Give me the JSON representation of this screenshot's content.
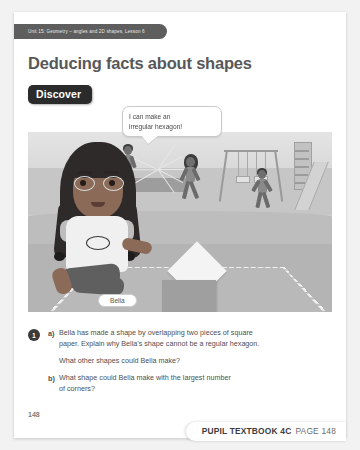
{
  "page": {
    "unit_banner": "Unit 15: Geometry – angles and 2D shapes, Lesson 6",
    "title": "Deducing facts about shapes",
    "section_badge": "Discover",
    "folio": "148"
  },
  "illustration": {
    "speech_bubble": {
      "line1": "I can make an",
      "line2": "irregular hexagon!"
    },
    "character_label": "Bella",
    "scene_items": [
      "swing-frame",
      "slide",
      "climbing-frame",
      "bench",
      "running-children"
    ]
  },
  "questions": [
    {
      "number": "1",
      "parts": [
        {
          "letter": "a)",
          "lines": [
            "Bella has made a shape by overlapping two pieces of square",
            "paper. Explain why Bella's shape cannot be a regular hexagon."
          ],
          "followup": "What other shapes could Bella make?"
        },
        {
          "letter": "b)",
          "lines": [
            "What shape could Bella make with the largest number",
            "of corners?"
          ]
        }
      ]
    }
  ],
  "footer": {
    "book": "PUPIL TEXTBOOK 4C",
    "page": "PAGE 148"
  },
  "colors": {
    "banner": "#5e5e5e",
    "title": "#58585a",
    "badge": "#2b2b2b",
    "body_text": "#4f4f4f"
  }
}
